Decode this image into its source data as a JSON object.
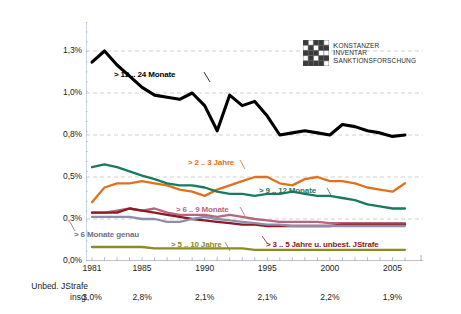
{
  "logo": {
    "name": "kis-logo",
    "line1": "KONSTANZER",
    "line2": "INVENTAR",
    "line3": "SANKTIONSFORSCHUNG"
  },
  "footer": {
    "title_line1": "Unbed. JStrafe",
    "title_line2": "insg.",
    "values": [
      {
        "year": 1981,
        "value": "3,0%"
      },
      {
        "year": 1985,
        "value": "2,8%"
      },
      {
        "year": 1990,
        "value": "2,1%"
      },
      {
        "year": 1995,
        "value": "2,1%"
      },
      {
        "year": 2000,
        "value": "2,2%"
      },
      {
        "year": 2005,
        "value": "1,9%"
      }
    ]
  },
  "chart_data": {
    "type": "line",
    "title": "",
    "xlabel": "",
    "ylabel": "",
    "grid": true,
    "legend": "inline-annotations",
    "xlim": [
      1981,
      2006
    ],
    "x": [
      1981,
      1982,
      1983,
      1984,
      1985,
      1986,
      1987,
      1988,
      1989,
      1990,
      1991,
      1992,
      1993,
      1994,
      1995,
      1996,
      1997,
      1998,
      1999,
      2000,
      2001,
      2002,
      2003,
      2004,
      2005,
      2006
    ],
    "xticks": [
      1981,
      1985,
      1990,
      1995,
      2000,
      2005
    ],
    "ytick_labels": [
      "1,3%",
      "1,0%",
      "0,8%",
      "0,5%",
      "0,3%",
      "0,0%"
    ],
    "ytick_values": [
      1.3,
      1.0,
      0.8,
      0.5,
      0.3,
      0.0
    ],
    "series": [
      {
        "name": "> 12 .. 24 Monate",
        "label": "> 12 .. 24 Monate",
        "color": "#000000",
        "values": [
          1.22,
          1.3,
          1.2,
          1.12,
          1.04,
          0.99,
          0.98,
          0.97,
          1.0,
          0.94,
          0.82,
          0.99,
          0.94,
          0.96,
          0.89,
          0.8,
          0.81,
          0.82,
          0.81,
          0.8,
          0.85,
          0.84,
          0.82,
          0.81,
          0.79,
          0.8
        ]
      },
      {
        "name": "> 2 .. 3 Jahre",
        "label": "> 2 .. 3 Jahre",
        "color": "#e2711d",
        "values": [
          0.38,
          0.45,
          0.47,
          0.47,
          0.48,
          0.47,
          0.46,
          0.44,
          0.43,
          0.41,
          0.44,
          0.46,
          0.48,
          0.5,
          0.5,
          0.47,
          0.46,
          0.49,
          0.5,
          0.48,
          0.48,
          0.47,
          0.45,
          0.44,
          0.43,
          0.47
        ]
      },
      {
        "name": "> 9 .. 12 Monate",
        "label": "> 9 .. 12 Monate",
        "color": "#1a7a60",
        "values": [
          0.57,
          0.59,
          0.57,
          0.54,
          0.51,
          0.49,
          0.47,
          0.46,
          0.46,
          0.45,
          0.43,
          0.42,
          0.42,
          0.41,
          0.42,
          0.42,
          0.43,
          0.42,
          0.41,
          0.41,
          0.4,
          0.39,
          0.37,
          0.36,
          0.35,
          0.35
        ]
      },
      {
        "name": "> 6 .. 9 Monate",
        "label": "> 6 .. 9 Monate",
        "color": "#b8657f",
        "values": [
          0.33,
          0.33,
          0.34,
          0.35,
          0.34,
          0.35,
          0.33,
          0.32,
          0.32,
          0.32,
          0.31,
          0.32,
          0.31,
          0.3,
          0.29,
          0.28,
          0.28,
          0.28,
          0.28,
          0.27,
          0.27,
          0.27,
          0.27,
          0.27,
          0.27,
          0.27
        ]
      },
      {
        "name": "> 3 .. 5 Jahre u. unbest. JStrafe",
        "label": "> 3 .. 5 Jahre u. unbest. JStrafe",
        "color": "#8c1a22",
        "values": [
          0.33,
          0.33,
          0.33,
          0.35,
          0.34,
          0.33,
          0.32,
          0.31,
          0.3,
          0.29,
          0.28,
          0.27,
          0.26,
          0.26,
          0.25,
          0.25,
          0.25,
          0.25,
          0.25,
          0.25,
          0.26,
          0.26,
          0.26,
          0.26,
          0.26,
          0.26
        ]
      },
      {
        "name": "> 6 Monate genau",
        "label": "> 6 Monate genau",
        "color": "#8e8eac",
        "values": [
          0.31,
          0.31,
          0.31,
          0.31,
          0.3,
          0.3,
          0.28,
          0.28,
          0.3,
          0.31,
          0.3,
          0.29,
          0.28,
          0.27,
          0.26,
          0.26,
          0.25,
          0.25,
          0.25,
          0.25,
          0.25,
          0.25,
          0.25,
          0.25,
          0.25,
          0.25
        ]
      },
      {
        "name": "> 5 .. 10 Jahre",
        "label": "> 5 .. 10 Jahre",
        "color": "#8a8a28",
        "values": [
          0.1,
          0.1,
          0.1,
          0.1,
          0.1,
          0.09,
          0.09,
          0.09,
          0.09,
          0.09,
          0.09,
          0.09,
          0.09,
          0.08,
          0.08,
          0.08,
          0.08,
          0.08,
          0.08,
          0.08,
          0.08,
          0.08,
          0.08,
          0.08,
          0.08,
          0.08
        ]
      }
    ],
    "annotations": [
      {
        "name": "annotation-12-24-monate",
        "text": "> 12 .. 24 Monate",
        "color": "#000000",
        "x": 114,
        "y": 70
      },
      {
        "name": "annotation-2-3-jahre",
        "text": "> 2 .. 3 Jahre",
        "color": "#e2711d",
        "x": 188,
        "y": 158
      },
      {
        "name": "annotation-9-12-monate",
        "text": "> 9 .. 12 Monate",
        "color": "#1a7a60",
        "x": 259,
        "y": 186
      },
      {
        "name": "annotation-6-9-monate",
        "text": "> 6 .. 9 Monate",
        "color": "#b8657f",
        "x": 176,
        "y": 205
      },
      {
        "name": "annotation-6-monate-genau",
        "text": "> 6 Monate genau",
        "color": "#6f6f84",
        "x": 74,
        "y": 230
      },
      {
        "name": "annotation-5-10-jahre",
        "text": "> 5 .. 10 Jahre",
        "color": "#8a8a28",
        "x": 171,
        "y": 240
      },
      {
        "name": "annotation-3-5-jahre",
        "text": "> 3 .. 5 Jahre u. unbest. JStrafe",
        "color": "#8c1a22",
        "x": 266,
        "y": 240
      }
    ]
  }
}
